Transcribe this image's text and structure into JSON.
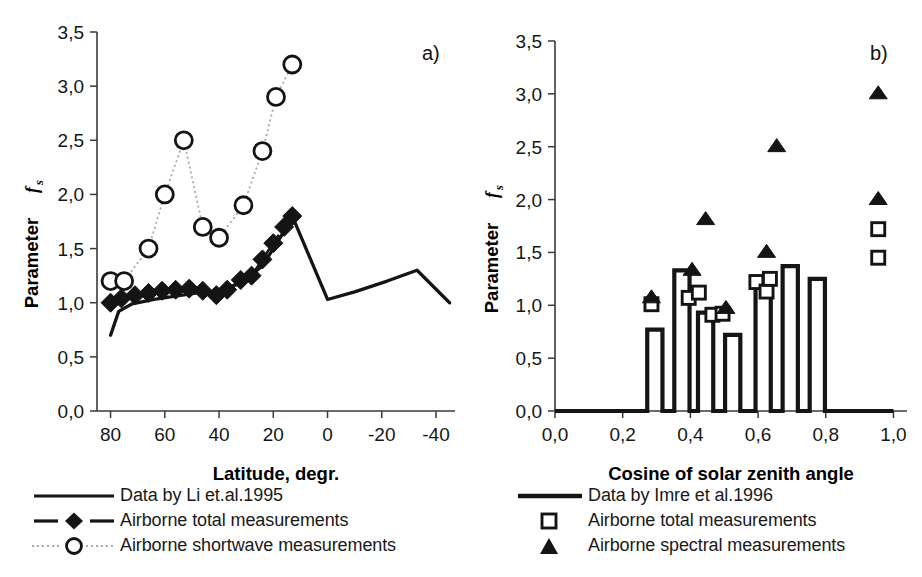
{
  "figure": {
    "panel_a_tag": "a)",
    "panel_b_tag": "b)"
  },
  "panel_a": {
    "tag": "a)",
    "ylabel_main": "Parameter",
    "ylabel_symbol": "f",
    "ylabel_subscript": "s",
    "xlabel": "Latitude, degr.",
    "y_ticks": [
      "0,0",
      "0,5",
      "1,0",
      "1,5",
      "2,0",
      "2,5",
      "3,0",
      "3,5"
    ],
    "x_ticks": [
      "80",
      "60",
      "40",
      "20",
      "0",
      "-20",
      "-40"
    ],
    "legend": [
      {
        "key": "solid-line",
        "label": "Data by Li et.al.1995"
      },
      {
        "key": "dashed-line-diamond",
        "label": "Airborne total measurements"
      },
      {
        "key": "dotted-line-circle",
        "label": "Airborne shortwave measurements"
      }
    ]
  },
  "panel_b": {
    "tag": "b)",
    "ylabel_main": "Parameter",
    "ylabel_symbol": "f",
    "ylabel_subscript": "s",
    "xlabel": "Cosine of solar zenith angle",
    "y_ticks": [
      "0,0",
      "0,5",
      "1,0",
      "1,5",
      "2,0",
      "2,5",
      "3,0",
      "3,5"
    ],
    "x_ticks": [
      "0,0",
      "0,2",
      "0,4",
      "0,6",
      "0,8",
      "1,0"
    ],
    "legend": [
      {
        "key": "solid-line",
        "label": "Data by Imre et al.1996"
      },
      {
        "key": "open-square",
        "label": "Airborne total measurements"
      },
      {
        "key": "filled-triangle",
        "label": "Airborne spectral measurements"
      }
    ]
  },
  "chart_data": [
    {
      "id": "panel-a",
      "type": "line",
      "title": "",
      "panel_label": "a)",
      "xlabel": "Latitude, degr.",
      "ylabel": "Parameter f_s",
      "xlim": [
        85,
        -47
      ],
      "ylim": [
        0.0,
        3.5
      ],
      "x_ticks": [
        80,
        60,
        40,
        20,
        0,
        -20,
        -40
      ],
      "y_ticks": [
        0.0,
        0.5,
        1.0,
        1.5,
        2.0,
        2.5,
        3.0,
        3.5
      ],
      "x_inverted": true,
      "grid": false,
      "legend_position": "below",
      "series": [
        {
          "name": "Data by Li et.al.1995",
          "style": "solid-line",
          "marker": "none",
          "x": [
            80,
            77,
            72,
            64,
            56,
            48,
            40,
            32,
            24,
            17,
            13,
            0,
            -10,
            -22,
            -33,
            -45
          ],
          "y": [
            0.7,
            0.92,
            0.99,
            1.03,
            1.06,
            1.09,
            1.11,
            1.18,
            1.34,
            1.62,
            1.8,
            1.03,
            1.1,
            1.2,
            1.3,
            1.0
          ]
        },
        {
          "name": "Airborne total measurements",
          "style": "dashed-line",
          "marker": "filled-diamond",
          "x": [
            80,
            76,
            71,
            66,
            61,
            56,
            51,
            46,
            41,
            37,
            32,
            28,
            24,
            20,
            16,
            13
          ],
          "y": [
            1.0,
            1.04,
            1.07,
            1.09,
            1.11,
            1.12,
            1.13,
            1.11,
            1.07,
            1.12,
            1.21,
            1.25,
            1.4,
            1.55,
            1.7,
            1.8
          ]
        },
        {
          "name": "Airborne shortwave measurements",
          "style": "dotted-line",
          "marker": "open-circle",
          "x": [
            80,
            75,
            66,
            60,
            53,
            46,
            40,
            31,
            24,
            19,
            13
          ],
          "y": [
            1.2,
            1.2,
            1.5,
            2.0,
            2.5,
            1.7,
            1.6,
            1.9,
            2.4,
            2.9,
            3.2
          ]
        }
      ]
    },
    {
      "id": "panel-b",
      "type": "bar",
      "title": "",
      "panel_label": "b)",
      "xlabel": "Cosine of solar zenith angle",
      "ylabel": "Parameter f_s",
      "xlim": [
        0.0,
        1.04
      ],
      "ylim": [
        0.0,
        3.5
      ],
      "x_ticks": [
        0.0,
        0.2,
        0.4,
        0.6,
        0.8,
        1.0
      ],
      "y_ticks": [
        0.0,
        0.5,
        1.0,
        1.5,
        2.0,
        2.5,
        3.0,
        3.5
      ],
      "grid": false,
      "legend_position": "below",
      "bars": {
        "name": "Data by Imre et al.1996",
        "style": "step-outline",
        "centers": [
          0.295,
          0.375,
          0.445,
          0.525,
          0.615,
          0.695,
          0.775
        ],
        "width": 0.045,
        "values": [
          0.77,
          1.33,
          0.93,
          0.72,
          1.22,
          1.37,
          1.25
        ]
      },
      "series": [
        {
          "name": "Airborne total measurements",
          "style": "markers",
          "marker": "open-square",
          "x": [
            0.285,
            0.395,
            0.425,
            0.465,
            0.495,
            0.595,
            0.625,
            0.635,
            0.955,
            0.955
          ],
          "y": [
            1.01,
            1.07,
            1.12,
            0.91,
            0.92,
            1.22,
            1.13,
            1.25,
            1.72,
            1.45
          ]
        },
        {
          "name": "Airborne spectral measurements",
          "style": "markers",
          "marker": "filled-triangle",
          "x": [
            0.285,
            0.405,
            0.445,
            0.505,
            0.625,
            0.655,
            0.955,
            0.955
          ],
          "y": [
            1.07,
            1.33,
            1.81,
            0.97,
            1.5,
            2.5,
            3.0,
            2.0
          ]
        }
      ]
    }
  ]
}
